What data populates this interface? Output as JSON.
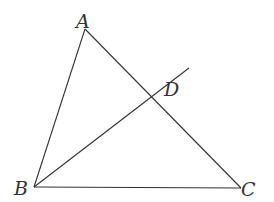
{
  "diagram": {
    "type": "geometry",
    "points": {
      "A": {
        "label": "A",
        "x": 85,
        "y": 29
      },
      "B": {
        "label": "B",
        "x": 34,
        "y": 187
      },
      "C": {
        "label": "C",
        "x": 241,
        "y": 188
      },
      "D": {
        "label": "D",
        "x": 152,
        "y": 97
      }
    },
    "segments": [
      {
        "from": "A",
        "to": "B"
      },
      {
        "from": "A",
        "to": "C"
      },
      {
        "from": "B",
        "to": "C"
      },
      {
        "from": "B",
        "to": "D",
        "extended_to": {
          "x": 189,
          "y": 68
        }
      }
    ],
    "labels": [
      "A",
      "B",
      "C",
      "D"
    ]
  }
}
